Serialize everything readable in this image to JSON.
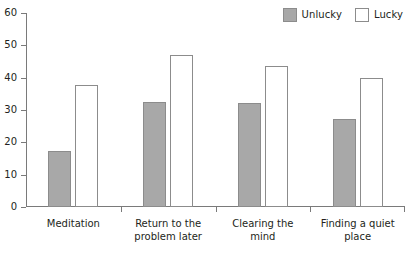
{
  "chart_data": {
    "type": "bar",
    "title": "",
    "subtitle": "",
    "xlabel": "",
    "ylabel": "",
    "categories": [
      "Meditation",
      "Return to the\nproblem later",
      "Clearing the\nmind",
      "Finding a quiet\nplace"
    ],
    "series": [
      {
        "name": "Unlucky",
        "color": "#a8a8a8",
        "values": [
          17.3,
          32.5,
          32.3,
          27.2
        ]
      },
      {
        "name": "Lucky",
        "color": "#ffffff",
        "values": [
          37.6,
          47.0,
          43.5,
          39.8
        ]
      }
    ],
    "ylim": [
      0,
      60
    ],
    "yticks": [
      0,
      10,
      20,
      30,
      40,
      50,
      60
    ],
    "ytick_labels": [
      "0",
      "10",
      "20",
      "30",
      "40",
      "50",
      "60"
    ],
    "grid": false,
    "legend_position": "top-right",
    "legend": [
      {
        "label": "Unlucky",
        "swatch": "#a8a8a8"
      },
      {
        "label": "Lucky",
        "swatch": "#ffffff"
      }
    ]
  }
}
